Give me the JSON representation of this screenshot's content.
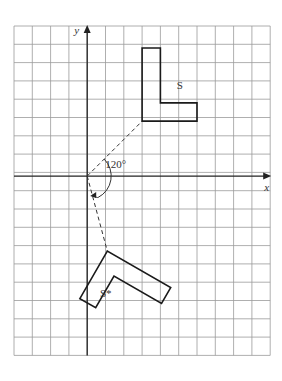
{
  "diagram": {
    "type": "coordinate-grid-rotation",
    "grid": {
      "left_px": 14,
      "top_px": 26,
      "cell_px": 18.3,
      "cols": 14,
      "rows": 18,
      "origin_col": 4,
      "origin_row": 8.2
    },
    "axes": {
      "x_label": "x",
      "y_label": "y"
    },
    "shape_original": {
      "label": "S",
      "vertices": [
        [
          3,
          3
        ],
        [
          6,
          3
        ],
        [
          6,
          4
        ],
        [
          4,
          4
        ],
        [
          4,
          7
        ],
        [
          3,
          7
        ]
      ]
    },
    "shape_image": {
      "label": "S*",
      "rotation_degrees": -120,
      "center": [
        0,
        0
      ]
    },
    "angle_label": "120°",
    "colors": {
      "grid": "#9a9a9a",
      "ink": "#1a1a1a"
    }
  }
}
